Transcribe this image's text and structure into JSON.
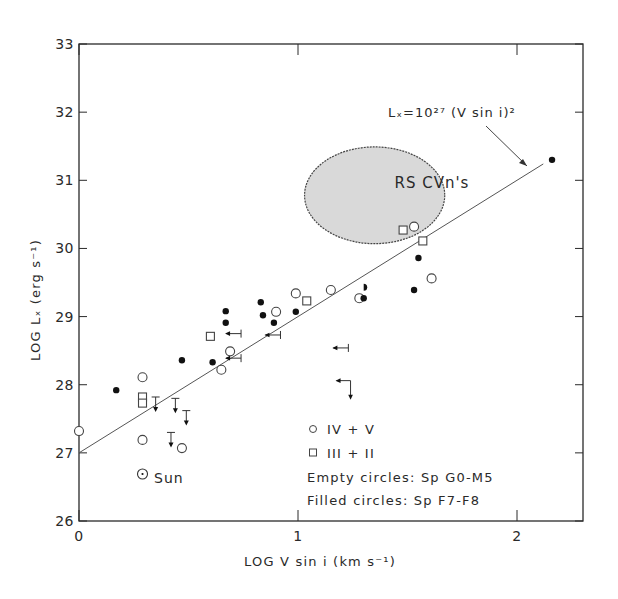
{
  "chart_data": {
    "type": "scatter",
    "title": "",
    "xlabel": "LOG V sin i (km s⁻¹)",
    "ylabel": "LOG Lₓ (erg s⁻¹)",
    "xlim": [
      0,
      2.3
    ],
    "ylim": [
      26,
      33
    ],
    "x_ticks": [
      0,
      1,
      2
    ],
    "x_tick_labels": [
      "0",
      "1",
      "2"
    ],
    "y_ticks": [
      26,
      27,
      28,
      29,
      30,
      31,
      32,
      33
    ],
    "y_tick_labels": [
      "26",
      "27",
      "28",
      "29",
      "30",
      "31",
      "32",
      "33"
    ],
    "grid": false,
    "fit_line": {
      "label": "Lₓ=10²⁷ (V sin i)²",
      "intercept": 27.0,
      "slope": 2.0,
      "x_range": [
        0,
        2.12
      ]
    },
    "region": {
      "label": "RS CVn's",
      "center": [
        1.35,
        30.78
      ],
      "semi_axes": [
        0.32,
        0.71
      ],
      "fill": "#d9d9d9"
    },
    "series": [
      {
        "name": "Empty circles (IV+V, Sp G0-M5)",
        "marker": "open-circle",
        "points": [
          [
            0.0,
            27.32
          ],
          [
            0.29,
            28.11
          ],
          [
            0.29,
            27.19
          ],
          [
            0.47,
            27.07
          ],
          [
            0.65,
            28.22
          ],
          [
            0.69,
            28.49
          ],
          [
            0.9,
            29.07
          ],
          [
            0.99,
            29.34
          ],
          [
            1.15,
            29.39
          ],
          [
            1.28,
            29.27
          ],
          [
            1.53,
            30.32
          ],
          [
            1.61,
            29.56
          ]
        ]
      },
      {
        "name": "Squares (III+II)",
        "marker": "open-square",
        "points": [
          [
            0.29,
            27.82
          ],
          [
            0.29,
            27.73
          ],
          [
            0.6,
            28.71
          ],
          [
            1.04,
            29.23
          ],
          [
            1.48,
            30.27
          ],
          [
            1.57,
            30.11
          ]
        ]
      },
      {
        "name": "Filled circles (Sp F7-F8)",
        "marker": "filled-circle",
        "points": [
          [
            0.17,
            27.92
          ],
          [
            0.47,
            28.36
          ],
          [
            0.61,
            28.33
          ],
          [
            0.67,
            29.08
          ],
          [
            0.67,
            28.91
          ],
          [
            0.83,
            29.21
          ],
          [
            0.84,
            29.02
          ],
          [
            0.89,
            28.91
          ],
          [
            0.99,
            29.07
          ],
          [
            1.3,
            29.27
          ],
          [
            1.53,
            29.39
          ],
          [
            1.55,
            29.86
          ],
          [
            2.16,
            31.3
          ]
        ]
      },
      {
        "name": "Half-filled circle",
        "marker": "half-circle",
        "points": [
          [
            1.3,
            29.43
          ]
        ]
      },
      {
        "name": "Upper limits in Lₓ",
        "marker": "down-arrow",
        "points": [
          [
            0.35,
            27.82
          ],
          [
            0.44,
            27.8
          ],
          [
            0.49,
            27.62
          ],
          [
            0.42,
            27.3
          ]
        ]
      },
      {
        "name": "Upper limits in V sin i",
        "marker": "left-arrow",
        "points": [
          [
            0.74,
            28.75
          ],
          [
            0.92,
            28.73
          ],
          [
            0.74,
            28.39
          ],
          [
            1.23,
            28.54
          ]
        ]
      },
      {
        "name": "Upper limits in both",
        "marker": "left-down-arrow",
        "points": [
          [
            1.24,
            28.06
          ]
        ]
      }
    ],
    "sun": {
      "label": "Sun",
      "point": [
        0.29,
        26.69
      ]
    },
    "legend": {
      "placement": "lower-right",
      "entries": [
        {
          "marker": "open-circle",
          "label": "IV + V"
        },
        {
          "marker": "open-square",
          "label": "III + II"
        },
        {
          "marker": "none",
          "label": "Empty circles: Sp G0-M5"
        },
        {
          "marker": "none",
          "label": "Filled circles: Sp F7-F8"
        }
      ]
    }
  }
}
